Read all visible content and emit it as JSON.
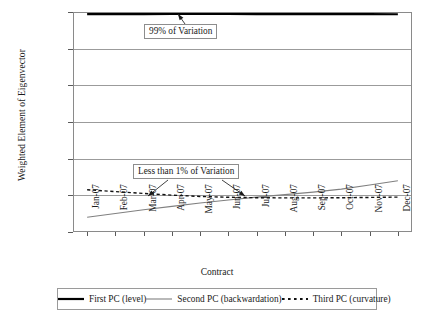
{
  "chart_data": {
    "type": "line",
    "title": "",
    "xlabel": "Contract",
    "ylabel": "Weighted Element of Eigenvector",
    "categories": [
      "Jan-07",
      "Feb-07",
      "Mar-07",
      "Apr-07",
      "May-07",
      "Jun-07",
      "Jul-07",
      "Aug-07",
      "Sep-07",
      "Oct-07",
      "Nov-07",
      "Dec-07"
    ],
    "ylim": [
      -0.2,
      1.0
    ],
    "yticks": [
      "1.0000",
      "0.8000",
      "0.6000",
      "0.4000",
      "0.2000",
      "0.0000",
      "-0.2000"
    ],
    "ytick_values": [
      1.0,
      0.8,
      0.6,
      0.4,
      0.2,
      0.0,
      -0.2
    ],
    "grid": true,
    "legend_position": "bottom",
    "series": [
      {
        "name": "First PC (level)",
        "style": "solid",
        "color": "#000000",
        "width": 2.2,
        "values": [
          0.988,
          0.9885,
          0.9888,
          0.989,
          0.989,
          0.989,
          0.9888,
          0.9886,
          0.9884,
          0.9882,
          0.988,
          0.9878
        ]
      },
      {
        "name": "Second PC (backwardation)",
        "style": "solid",
        "color": "#808080",
        "width": 1.1,
        "values": [
          -0.12,
          -0.099,
          -0.079,
          -0.06,
          -0.042,
          -0.0255,
          -0.01,
          0.004,
          0.0175,
          0.034,
          0.056,
          0.08
        ]
      },
      {
        "name": "Third PC (curvature)",
        "style": "dashed",
        "color": "#111111",
        "width": 1.4,
        "values": [
          0.0305,
          0.0205,
          0.0105,
          0.001,
          -0.006,
          -0.0105,
          -0.013,
          -0.014,
          -0.014,
          -0.013,
          -0.0115,
          -0.0095
        ]
      }
    ],
    "annotations": [
      {
        "id": "a99",
        "text": "99% of Variation",
        "arrows": 1
      },
      {
        "id": "alt1",
        "text": "Less than 1% of Variation",
        "arrows": 2
      }
    ]
  },
  "legend": {
    "items": [
      {
        "label": "First PC (level)",
        "swatch": "line-solid-black-icon"
      },
      {
        "label": "Second PC (backwardation)",
        "swatch": "line-solid-gray-icon"
      },
      {
        "label": "Third PC (curvature)",
        "swatch": "line-dashed-black-icon"
      }
    ]
  }
}
